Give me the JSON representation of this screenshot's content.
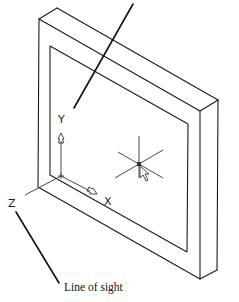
{
  "diagram": {
    "axis_labels": {
      "x": "X",
      "y": "Y",
      "z": "Z"
    },
    "annotations": {
      "line_of_sight": "Line of sight"
    },
    "elements": [
      "frame-outer-front",
      "frame-depth-back",
      "frame-inner-opening",
      "ucs-icon",
      "crosshair-cursor",
      "leader-top",
      "leader-line-of-sight"
    ],
    "colors": {
      "line": "#1a1a1a",
      "background": "#ffffff"
    }
  }
}
